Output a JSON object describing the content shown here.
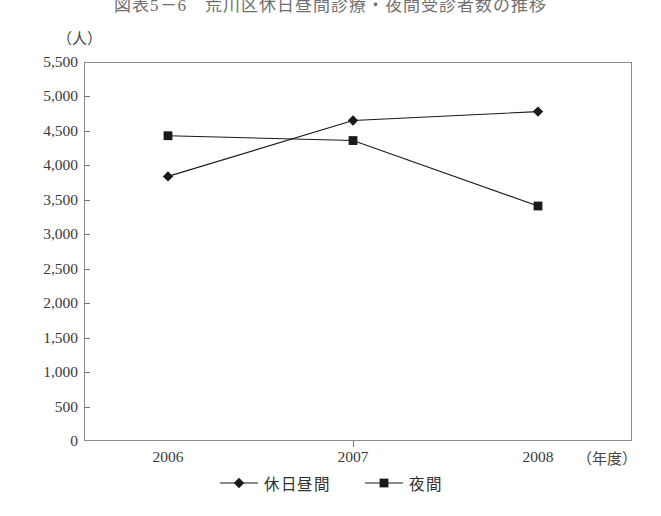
{
  "title": "図表5－6　荒川区休日昼間診療・夜間受診者数の推移",
  "y_axis": {
    "unit": "（人）",
    "ticks": [
      "5,500",
      "5,000",
      "4,500",
      "4,000",
      "3,500",
      "3,000",
      "2,500",
      "2,000",
      "1,500",
      "1,000",
      "500",
      "0"
    ]
  },
  "x_axis": {
    "unit": "（年度）",
    "ticks": [
      "2006",
      "2007",
      "2008"
    ]
  },
  "legend": {
    "series": [
      {
        "label": "休日昼間",
        "marker": "diamond-marker-icon",
        "color": "#1a1a1a"
      },
      {
        "label": "夜間",
        "marker": "square-marker-icon",
        "color": "#1a1a1a"
      }
    ]
  },
  "chart_data": {
    "type": "line",
    "title": "図表5－6　荒川区休日昼間診療・夜間受診者数の推移",
    "xlabel": "（年度）",
    "ylabel": "（人）",
    "categories": [
      "2006",
      "2007",
      "2008"
    ],
    "series": [
      {
        "name": "休日昼間",
        "marker": "diamond",
        "values": [
          3840,
          4650,
          4780
        ]
      },
      {
        "name": "夜間",
        "marker": "square",
        "values": [
          4430,
          4360,
          3410
        ]
      }
    ],
    "ylim": [
      0,
      5500
    ],
    "ytick_step": 500,
    "grid": false,
    "legend_position": "bottom-center"
  }
}
